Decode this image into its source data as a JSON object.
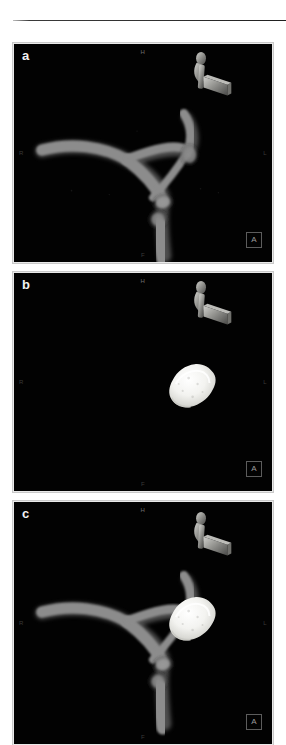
{
  "figure": {
    "kind": "3d-rotational-angiography",
    "panel_count": 3,
    "background_color": "#ffffff",
    "image_background_color": "#000000",
    "vessel_color": "#8c8c8c",
    "coil_color": "#f7f7f5",
    "clip_color": "#9a9a96",
    "marker_color": "#6e6e6e",
    "frame_color": "#e9e9e9"
  },
  "panels": [
    {
      "letter": "a",
      "markers": {
        "superior": "H",
        "inferior": "F",
        "right": "R",
        "left": "L"
      },
      "view_indicator": "A",
      "content": {
        "vessels_visible": "yes",
        "coil_mass_visible": "no",
        "clip_visible": "yes"
      }
    },
    {
      "letter": "b",
      "markers": {
        "superior": "H",
        "inferior": "F",
        "right": "R",
        "left": "L"
      },
      "view_indicator": "A",
      "content": {
        "vessels_visible": "no",
        "coil_mass_visible": "yes",
        "clip_visible": "yes"
      }
    },
    {
      "letter": "c",
      "markers": {
        "superior": "H",
        "inferior": "F",
        "right": "R",
        "left": "L"
      },
      "view_indicator": "A",
      "content": {
        "vessels_visible": "yes",
        "coil_mass_visible": "yes",
        "clip_visible": "yes"
      }
    }
  ]
}
